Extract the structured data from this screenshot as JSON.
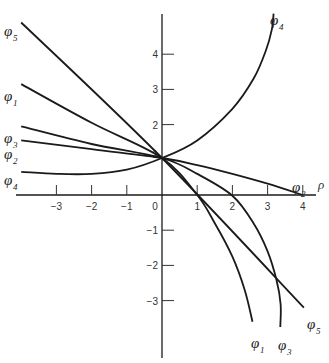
{
  "chart_data": {
    "type": "line",
    "title": "",
    "xlabel": "ρ",
    "ylabel": "",
    "xlim": [
      -4,
      4.5
    ],
    "ylim": [
      -4.6,
      5.2
    ],
    "grid": false,
    "legend": "inline labels at curve ends",
    "x_ticks": [
      -3,
      -2,
      -1,
      0,
      1,
      2,
      3,
      4
    ],
    "x_tick_labels": [
      "-3",
      "-2",
      "-1",
      "0",
      "1",
      "2",
      "3",
      "4"
    ],
    "y_ticks": [
      4,
      3,
      2,
      1,
      -1,
      -2,
      -3
    ],
    "y_tick_labels": [
      "4",
      "3",
      "2",
      "1",
      "-1",
      "-2",
      "-3"
    ],
    "series": [
      {
        "name": "φ5",
        "label": "φ",
        "sub": "5",
        "points": [
          [
            -4,
            4.9
          ],
          [
            0,
            1.05
          ],
          [
            4.03,
            -3.2
          ]
        ]
      },
      {
        "name": "φ1",
        "label": "φ",
        "sub": "1",
        "points": [
          [
            -4,
            3.15
          ],
          [
            -2,
            2.05
          ],
          [
            0,
            1.05
          ],
          [
            1,
            0.0
          ],
          [
            1.5,
            -0.8
          ],
          [
            2,
            -1.75
          ],
          [
            2.35,
            -2.7
          ],
          [
            2.57,
            -3.6
          ]
        ]
      },
      {
        "name": "φ3",
        "label": "φ",
        "sub": "3",
        "points": [
          [
            -4,
            1.95
          ],
          [
            -2,
            1.45
          ],
          [
            0,
            1.05
          ],
          [
            1,
            0.6
          ],
          [
            2,
            -0.02
          ],
          [
            2.6,
            -0.8
          ],
          [
            3.0,
            -1.6
          ],
          [
            3.25,
            -2.4
          ],
          [
            3.37,
            -3.1
          ],
          [
            3.36,
            -3.75
          ]
        ]
      },
      {
        "name": "φ2",
        "label": "φ",
        "sub": "2",
        "points": [
          [
            -4,
            1.55
          ],
          [
            -2,
            1.3
          ],
          [
            0,
            1.05
          ],
          [
            1,
            0.85
          ],
          [
            2,
            0.6
          ],
          [
            3,
            0.32
          ],
          [
            4,
            0.0
          ]
        ]
      },
      {
        "name": "φ4",
        "label": "φ",
        "sub": "4",
        "points": [
          [
            -4,
            0.66
          ],
          [
            -3,
            0.6
          ],
          [
            -2,
            0.6
          ],
          [
            -1,
            0.72
          ],
          [
            0,
            1.05
          ],
          [
            1,
            1.55
          ],
          [
            2,
            2.45
          ],
          [
            2.6,
            3.3
          ],
          [
            2.95,
            4.1
          ],
          [
            3.12,
            4.7
          ],
          [
            3.17,
            5.15
          ]
        ]
      }
    ],
    "annotations": [
      "φ5 at upper left",
      "φ1",
      "φ3",
      "φ2",
      "φ4 at left",
      "φ4 at top",
      "φ2 near ρ=4",
      "φ1, φ3, φ5 at lower right",
      "ρ axis label"
    ]
  },
  "labels": {
    "left": [
      {
        "name": "phi5-left",
        "text": "φ",
        "sub": "5",
        "x": 4,
        "y": 24
      },
      {
        "name": "phi1-left",
        "text": "φ",
        "sub": "1",
        "x": 4,
        "y": 89
      },
      {
        "name": "phi3-left",
        "text": "φ",
        "sub": "3",
        "x": 4,
        "y": 131
      },
      {
        "name": "phi2-left",
        "text": "φ",
        "sub": "2",
        "x": 4,
        "y": 147
      },
      {
        "name": "phi4-left",
        "text": "φ",
        "sub": "4",
        "x": 4,
        "y": 173
      }
    ],
    "right": [
      {
        "name": "phi4-top",
        "text": "φ",
        "sub": "4",
        "x": 270,
        "y": 13
      },
      {
        "name": "phi2-right",
        "text": "φ",
        "sub": "2",
        "x": 292,
        "y": 180
      },
      {
        "name": "phi1-bottom",
        "text": "φ",
        "sub": "1",
        "x": 251,
        "y": 336
      },
      {
        "name": "phi3-bottom",
        "text": "φ",
        "sub": "3",
        "x": 278,
        "y": 338
      },
      {
        "name": "phi5-bottom",
        "text": "φ",
        "sub": "5",
        "x": 307,
        "y": 317
      }
    ],
    "rho": "ρ"
  }
}
